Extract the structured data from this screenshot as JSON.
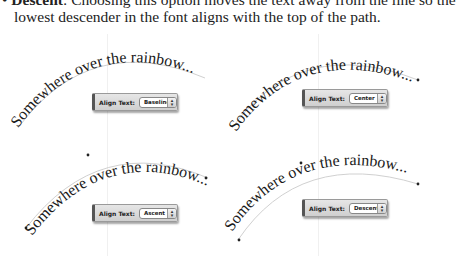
{
  "body_text": {
    "bullet": "•",
    "term": "Descent",
    "line1_rest": ": Choosing this option moves the text away from the line so the",
    "line2": "lowest descender in the font aligns with the top of the path."
  },
  "examples": [
    {
      "id": "baseline",
      "curve_text": "Somewhere over the rainbow...",
      "panel_label": "Align Text:",
      "selected": "Baseline"
    },
    {
      "id": "center",
      "curve_text": "Somewhere over the rainbow...",
      "panel_label": "Align Text:",
      "selected": "Center"
    },
    {
      "id": "ascent",
      "curve_text": "Somewhere over the rainbow...",
      "panel_label": "Align Text:",
      "selected": "Ascent"
    },
    {
      "id": "descent",
      "curve_text": "Somewhere over the rainbow...",
      "panel_label": "Align Text:",
      "selected": "Descent"
    }
  ],
  "icons": {
    "stepper": "up-down-arrows-icon",
    "bullet": "bullet-icon"
  },
  "colors": {
    "path": "#bdbdbd",
    "text": "#1a1a1a",
    "panel_bg": "#d8d8d8"
  }
}
